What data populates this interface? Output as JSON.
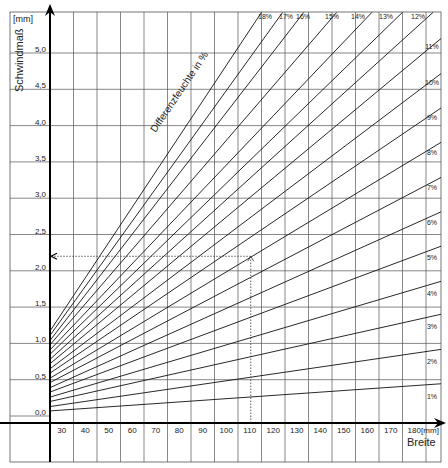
{
  "chart_data": {
    "type": "line",
    "title": "",
    "ylabel": "Schwindmaß",
    "yunit": "[mm]",
    "xlabel": "Breite",
    "xunit": "[mm]",
    "annotation": "Differenzfeuchte in %",
    "xlim": [
      25,
      194
    ],
    "ylim": [
      0,
      5.6
    ],
    "grid": true,
    "x_ticks": [
      30,
      40,
      50,
      60,
      70,
      80,
      90,
      100,
      110,
      120,
      130,
      140,
      150,
      160,
      170,
      180
    ],
    "x_tick_labels": [
      "30",
      "40",
      "50",
      "60",
      "70",
      "80",
      "90",
      "100",
      "110",
      "120",
      "130",
      "140",
      "150",
      "160",
      "170",
      "180"
    ],
    "y_ticks": [
      0.0,
      0.5,
      1.0,
      1.5,
      2.0,
      2.5,
      3.0,
      3.5,
      4.0,
      4.5,
      5.0
    ],
    "y_tick_labels": [
      "0,0",
      "0,5",
      "1,0",
      "1,5",
      "2,0",
      "2,5",
      "3,0",
      "3,5",
      "4,0",
      "4,5",
      "5,0"
    ],
    "series_model": "Schwindmaß = k × Differenzfeuchte(%) × Breite",
    "k": 0.0026,
    "series": [
      {
        "name": "1%",
        "percent": 1,
        "x": [
          25,
          194
        ],
        "y": [
          0.07,
          0.45
        ]
      },
      {
        "name": "2%",
        "percent": 2,
        "x": [
          25,
          194
        ],
        "y": [
          0.13,
          0.93
        ]
      },
      {
        "name": "3%",
        "percent": 3,
        "x": [
          25,
          194
        ],
        "y": [
          0.2,
          1.42
        ]
      },
      {
        "name": "4%",
        "percent": 4,
        "x": [
          25,
          194
        ],
        "y": [
          0.26,
          1.88
        ]
      },
      {
        "name": "5%",
        "percent": 5,
        "x": [
          25,
          194
        ],
        "y": [
          0.33,
          2.37
        ]
      },
      {
        "name": "6%",
        "percent": 6,
        "x": [
          25,
          194
        ],
        "y": [
          0.39,
          2.85
        ]
      },
      {
        "name": "7%",
        "percent": 7,
        "x": [
          25,
          194
        ],
        "y": [
          0.46,
          3.33
        ]
      },
      {
        "name": "8%",
        "percent": 8,
        "x": [
          25,
          194
        ],
        "y": [
          0.52,
          3.82
        ]
      },
      {
        "name": "9%",
        "percent": 9,
        "x": [
          25,
          194
        ],
        "y": [
          0.59,
          4.3
        ]
      },
      {
        "name": "10%",
        "percent": 10,
        "x": [
          25,
          194
        ],
        "y": [
          0.65,
          4.78
        ]
      },
      {
        "name": "11%",
        "percent": 11,
        "x": [
          25,
          194
        ],
        "y": [
          0.72,
          5.27
        ]
      },
      {
        "name": "12%",
        "percent": 12,
        "x": [
          25,
          188
        ],
        "y": [
          0.78,
          5.56
        ]
      },
      {
        "name": "13%",
        "percent": 13,
        "x": [
          25,
          175
        ],
        "y": [
          0.85,
          5.56
        ]
      },
      {
        "name": "14%",
        "percent": 14,
        "x": [
          25,
          162
        ],
        "y": [
          0.91,
          5.56
        ]
      },
      {
        "name": "15%",
        "percent": 15,
        "x": [
          25,
          147
        ],
        "y": [
          0.98,
          5.56
        ]
      },
      {
        "name": "16%",
        "percent": 16,
        "x": [
          25,
          133
        ],
        "y": [
          1.04,
          5.56
        ]
      },
      {
        "name": "17%",
        "percent": 17,
        "x": [
          25,
          124
        ],
        "y": [
          1.11,
          5.56
        ]
      },
      {
        "name": "18%",
        "percent": 18,
        "x": [
          25,
          115
        ],
        "y": [
          1.17,
          5.56
        ]
      }
    ],
    "example_reading": {
      "breite": 110,
      "schwindmass": 2.2,
      "style": "dotted arrows"
    }
  },
  "labels": {
    "yunit": "[mm]",
    "ylabel": "Schwindmaß",
    "xunit": "[mm]",
    "xlabel": "Breite",
    "annotation": "Differenzfeuchte in %"
  }
}
